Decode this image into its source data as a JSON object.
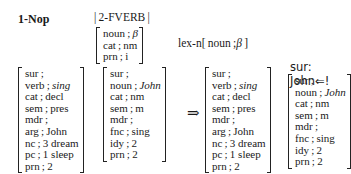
{
  "rule": {
    "name": "1-Nop",
    "rule_package": "2-FVERB",
    "lexicon_op": "lex-n",
    "lexicon_feature": "noun: β",
    "arrow": "⇒",
    "output_label": "sur: John⇐!"
  },
  "pattern_noun": [
    {
      "attr": "noun",
      "val": "β",
      "italic": false
    },
    {
      "attr": "cat",
      "val": "nm"
    },
    {
      "attr": "prn",
      "val": "i"
    }
  ],
  "input_verb": [
    {
      "attr": "sur",
      "val": ""
    },
    {
      "attr": "verb",
      "val": "sing",
      "italic": true
    },
    {
      "attr": "cat",
      "val": "decl"
    },
    {
      "attr": "sem",
      "val": "pres"
    },
    {
      "attr": "mdr",
      "val": ""
    },
    {
      "attr": "arg",
      "val": "John"
    },
    {
      "attr": "nc",
      "val": "3 dream"
    },
    {
      "attr": "pc",
      "val": "1 sleep"
    },
    {
      "attr": "prn",
      "val": "2"
    }
  ],
  "input_noun": [
    {
      "attr": "sur",
      "val": ""
    },
    {
      "attr": "noun",
      "val": "John",
      "italic": true
    },
    {
      "attr": "cat",
      "val": "nm"
    },
    {
      "attr": "sem",
      "val": "m"
    },
    {
      "attr": "mdr",
      "val": ""
    },
    {
      "attr": "fnc",
      "val": "sing"
    },
    {
      "attr": "idy",
      "val": "2"
    },
    {
      "attr": "prn",
      "val": "2"
    }
  ],
  "output_verb": [
    {
      "attr": "sur",
      "val": ""
    },
    {
      "attr": "verb",
      "val": "sing",
      "italic": true
    },
    {
      "attr": "cat",
      "val": "decl"
    },
    {
      "attr": "sem",
      "val": "pres"
    },
    {
      "attr": "mdr",
      "val": ""
    },
    {
      "attr": "arg",
      "val": "John"
    },
    {
      "attr": "nc",
      "val": "3 dream"
    },
    {
      "attr": "pc",
      "val": "1 sleep"
    },
    {
      "attr": "prn",
      "val": "2"
    }
  ],
  "output_noun": [
    {
      "attr": "sur",
      "val": ""
    },
    {
      "attr": "noun",
      "val": "John",
      "italic": true
    },
    {
      "attr": "cat",
      "val": "nm"
    },
    {
      "attr": "sem",
      "val": "m"
    },
    {
      "attr": "mdr",
      "val": ""
    },
    {
      "attr": "fnc",
      "val": "sing"
    },
    {
      "attr": "idy",
      "val": "2"
    },
    {
      "attr": "prn",
      "val": "2"
    }
  ]
}
